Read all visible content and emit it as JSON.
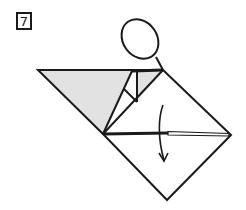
{
  "diagram": {
    "type": "origami-fold-step",
    "step_number": "7",
    "colors": {
      "line": "#1a1a1a",
      "paper_colored_side": "#e2e2e2",
      "paper_white_side": "#ffffff"
    },
    "elements": [
      {
        "name": "step-badge",
        "label": "7"
      },
      {
        "name": "magnify-circle",
        "description": "Detail callout ellipse above top corner"
      },
      {
        "name": "shaded-flap",
        "description": "Colored side of paper, left triangle"
      },
      {
        "name": "valley-fold-line",
        "description": "Horizontal fold across diamond"
      },
      {
        "name": "fold-direction-arrow",
        "description": "Curved arrow pointing down"
      }
    ]
  }
}
